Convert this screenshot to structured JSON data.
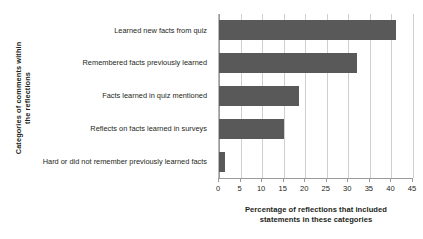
{
  "chart_data": {
    "type": "bar",
    "orientation": "horizontal",
    "title": "",
    "xlabel": "Percentage of reflections that included statements in these categories",
    "ylabel": "Categories of comments within the reflections",
    "categories": [
      "Learned new facts from quiz",
      "Remembered facts previously learned",
      "Facts learned in quiz mentioned",
      "Reflects on facts learned in surveys",
      "Hard or did not remember previously learned facts"
    ],
    "values": [
      41,
      32,
      18.5,
      15,
      1.5
    ],
    "xlim": [
      0,
      45
    ],
    "xticks": [
      0,
      5,
      10,
      15,
      20,
      25,
      30,
      35,
      40,
      45
    ],
    "xtick_labels": [
      "0",
      "5",
      "10",
      "15",
      "20",
      "25",
      "30",
      "35",
      "40",
      "45"
    ],
    "grid": true,
    "grid_axis": "x",
    "legend": false,
    "bar_color": "#595959",
    "grid_color": "#cfcfcf",
    "axis_color": "#9a9a9a",
    "background": "#ffffff",
    "text_color": "#231f20"
  },
  "axis": {
    "x_title_line1": "Percentage of reflections that included",
    "x_title_line2": "statements in these categories",
    "y_title_line1": "Categories of comments within",
    "y_title_line2": "the reflections"
  }
}
